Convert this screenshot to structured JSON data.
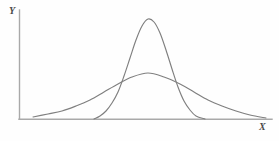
{
  "figure": {
    "background_color": "#fefefe",
    "axis_color": "#a9a9a9",
    "curve_color": "#7f7f7f"
  },
  "labels": {
    "y_axis": "Y",
    "x_axis": "X"
  },
  "chart_data": {
    "type": "line",
    "title": "",
    "subtitle": "",
    "xlabel": "X",
    "ylabel": "Y",
    "grid": false,
    "legend": null,
    "xlim": [
      0,
      1
    ],
    "ylim": [
      0,
      1
    ],
    "axis_ticks": {
      "x": [],
      "y": []
    },
    "annotations": [],
    "series": [
      {
        "name": "narrow-tall-normal-curve",
        "color": "#7f7f7f",
        "peak_x": 148,
        "peak_y": 19,
        "left_tail_x": 94,
        "right_tail_x": 205,
        "baseline_y": 119,
        "relative_height": 1.0,
        "relative_spread": 0.42,
        "x": [
          94,
          100,
          106,
          112,
          118,
          124,
          130,
          136,
          142,
          148,
          154,
          160,
          166,
          172,
          178,
          184,
          190,
          196,
          205
        ],
        "values": [
          119,
          116,
          111,
          103,
          92,
          76,
          58,
          40,
          26,
          19,
          22,
          33,
          50,
          69,
          87,
          101,
          110,
          116,
          119
        ]
      },
      {
        "name": "wide-flat-normal-curve",
        "color": "#7f7f7f",
        "peak_x": 148,
        "peak_y": 73,
        "left_tail_x": 33,
        "right_tail_x": 266,
        "baseline_y": 119,
        "relative_height": 0.43,
        "relative_spread": 1.0,
        "x": [
          33,
          48,
          62,
          76,
          90,
          104,
          118,
          132,
          148,
          164,
          180,
          194,
          208,
          222,
          236,
          250,
          266
        ],
        "values": [
          117,
          114,
          111,
          106,
          100,
          92,
          84,
          77,
          73,
          77,
          84,
          92,
          100,
          106,
          111,
          115,
          118
        ]
      }
    ],
    "intersections": [
      {
        "x": 118,
        "y": 79
      },
      {
        "x": 180,
        "y": 79
      }
    ]
  }
}
